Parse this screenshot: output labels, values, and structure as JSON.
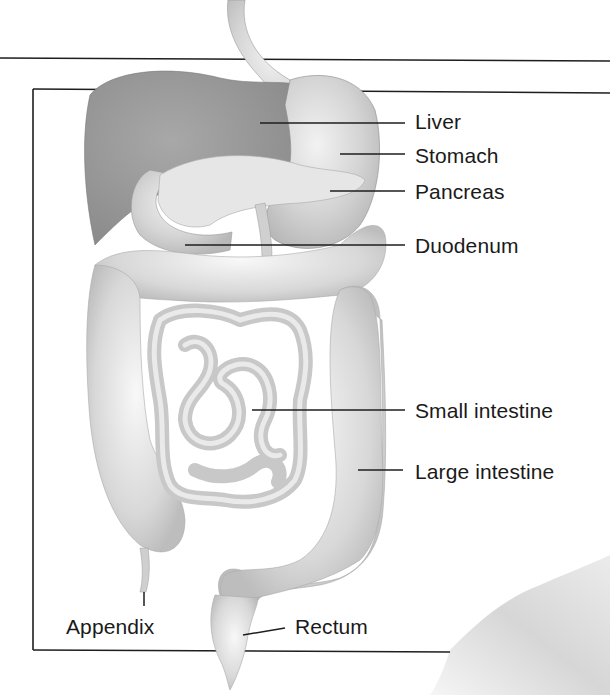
{
  "diagram": {
    "colors": {
      "background": "#ffffff",
      "line": "#1e1e1e",
      "label_text": "#1a1a1a",
      "liver": "#9a9a9a",
      "organ_light": "#d6d6d6",
      "organ_mid": "#c4c4c4",
      "pancreas": "#e4e4e4",
      "body_contour": "#c8c8c8"
    },
    "labels": [
      {
        "id": "liver",
        "text": "Liver",
        "x": 415,
        "y": 111,
        "leader": [
          260,
          123,
          405,
          123
        ]
      },
      {
        "id": "stomach",
        "text": "Stomach",
        "x": 415,
        "y": 145,
        "leader": [
          340,
          154,
          405,
          154
        ]
      },
      {
        "id": "pancreas",
        "text": "Pancreas",
        "x": 415,
        "y": 181,
        "leader": [
          330,
          191,
          405,
          191
        ]
      },
      {
        "id": "duodenum",
        "text": "Duodenum",
        "x": 415,
        "y": 235,
        "leader": [
          185,
          245,
          405,
          245
        ]
      },
      {
        "id": "small-intestine",
        "text": "Small intestine",
        "x": 415,
        "y": 400,
        "leader": [
          252,
          410,
          405,
          410
        ]
      },
      {
        "id": "large-intestine",
        "text": "Large intestine",
        "x": 415,
        "y": 461,
        "leader": [
          358,
          470,
          403,
          470
        ]
      },
      {
        "id": "appendix",
        "text": "Appendix",
        "x": 66,
        "y": 616,
        "leader": [
          144,
          592,
          144,
          606
        ]
      },
      {
        "id": "rectum",
        "text": "Rectum",
        "x": 295,
        "y": 616,
        "leader": [
          243,
          635,
          285,
          628
        ]
      }
    ],
    "frame": {
      "outer_top_line_y": 58,
      "box_left_x": 33,
      "box_top_y": 90,
      "box_bottom_y": 650,
      "box_bottom_right_x": 450
    }
  }
}
